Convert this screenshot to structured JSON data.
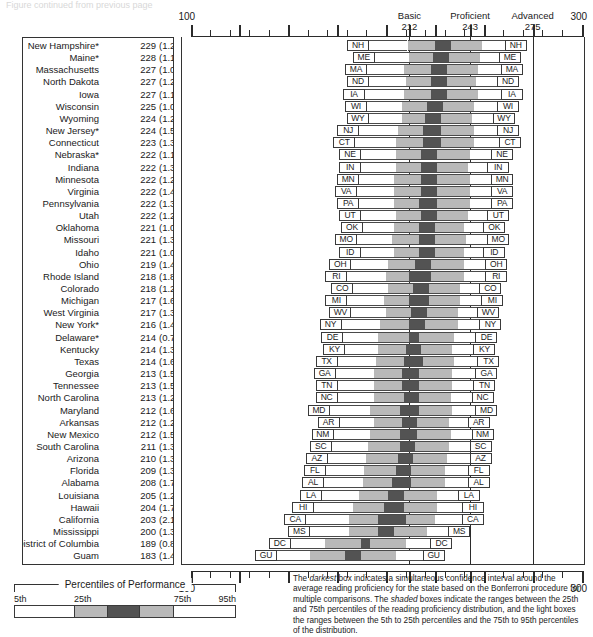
{
  "top_strip_text": "Figure continued from previous page",
  "axis": {
    "min": 100,
    "max": 300,
    "start_label": "100",
    "end_label": "300",
    "bottom_start_label": "100",
    "bottom_end_label": "300",
    "tick_step": 10,
    "major_ticks": [
      125,
      150,
      175,
      200,
      212,
      225,
      243,
      250,
      275,
      300
    ]
  },
  "benchmarks": [
    {
      "name": "Basic",
      "value": "212"
    },
    {
      "name": "Proficient",
      "value": "243"
    },
    {
      "name": "Advanced",
      "value": "275"
    }
  ],
  "legend": {
    "title": "Percentiles of Performance",
    "ticks": [
      "5th",
      "25th",
      "75th",
      "95th"
    ],
    "segments": [
      "light",
      "mid",
      "dark",
      "mid",
      "light"
    ]
  },
  "footnote": "The darkest box indicates a simultaneous confidence interval around the average reading proficiency for the state based on the Bonferroni procedure for multiple comparisons. The shaded boxes indicate the ranges between the 25th and 75th percentiles of the reading proficiency distribution, and the light boxes the ranges between the 5th to 25th percentiles and the 75th to 95th percentiles of the distribution.",
  "footnote_italics": [
    "darkest",
    "shaded"
  ],
  "colors": {
    "light_box": "#ffffff",
    "shaded_box": "#b9b9b9",
    "darkest_box": "#535353",
    "outline": "#4a4a4a",
    "axis": "#2b2b2b"
  },
  "chart_data": {
    "type": "bar",
    "xlabel": "Reading proficiency scale score",
    "ylabel": "State",
    "xlim": [
      100,
      300
    ],
    "grid": false,
    "legend_position": "bottom-left",
    "reference_lines": [
      {
        "label": "Basic",
        "value": 212
      },
      {
        "label": "Proficient",
        "value": 243
      },
      {
        "label": "Advanced",
        "value": 275
      }
    ],
    "columns": [
      "state",
      "mean",
      "se",
      "p5",
      "p25",
      "ci_low",
      "ci_high",
      "p75",
      "p95"
    ],
    "rows": [
      {
        "state": "New Hampshire*",
        "abbr": "NH",
        "mean": 229,
        "se": "1.2",
        "p5": 180,
        "p25": 211,
        "ci_low": 225,
        "ci_high": 233,
        "p75": 249,
        "p95": 272
      },
      {
        "state": "Maine*",
        "abbr": "ME",
        "mean": 228,
        "se": "1.1",
        "p5": 183,
        "p25": 212,
        "ci_low": 224,
        "ci_high": 232,
        "p75": 248,
        "p95": 269
      },
      {
        "state": "Massachusetts",
        "abbr": "MA",
        "mean": 227,
        "se": "1.0",
        "p5": 179,
        "p25": 209,
        "ci_low": 223,
        "ci_high": 231,
        "p75": 247,
        "p95": 270
      },
      {
        "state": "North Dakota",
        "abbr": "ND",
        "mean": 227,
        "se": "1.2",
        "p5": 180,
        "p25": 210,
        "ci_low": 223,
        "ci_high": 231,
        "p75": 246,
        "p95": 268
      },
      {
        "state": "Iowa",
        "abbr": "IA",
        "mean": 227,
        "se": "1.1",
        "p5": 178,
        "p25": 209,
        "ci_low": 223,
        "ci_high": 231,
        "p75": 247,
        "p95": 270
      },
      {
        "state": "Wisconsin",
        "abbr": "WI",
        "mean": 225,
        "se": "1.0",
        "p5": 179,
        "p25": 208,
        "ci_low": 221,
        "ci_high": 229,
        "p75": 245,
        "p95": 268
      },
      {
        "state": "Wyoming",
        "abbr": "WY",
        "mean": 224,
        "se": "1.2",
        "p5": 180,
        "p25": 208,
        "ci_low": 220,
        "ci_high": 228,
        "p75": 244,
        "p95": 266
      },
      {
        "state": "New Jersey*",
        "abbr": "NJ",
        "mean": 224,
        "se": "1.5",
        "p5": 175,
        "p25": 206,
        "ci_low": 219,
        "ci_high": 228,
        "p75": 245,
        "p95": 268
      },
      {
        "state": "Connecticut",
        "abbr": "CT",
        "mean": 223,
        "se": "1.3",
        "p5": 173,
        "p25": 205,
        "ci_low": 219,
        "ci_high": 228,
        "p75": 245,
        "p95": 269
      },
      {
        "state": "Nebraska*",
        "abbr": "NE",
        "mean": 222,
        "se": "1.1",
        "p5": 176,
        "p25": 205,
        "ci_low": 218,
        "ci_high": 226,
        "p75": 243,
        "p95": 265
      },
      {
        "state": "Indiana",
        "abbr": "IN",
        "mean": 222,
        "se": "1.3",
        "p5": 176,
        "p25": 205,
        "ci_low": 218,
        "ci_high": 226,
        "p75": 242,
        "p95": 263
      },
      {
        "state": "Minnesota",
        "abbr": "MN",
        "mean": 222,
        "se": "1.2",
        "p5": 175,
        "p25": 204,
        "ci_low": 218,
        "ci_high": 226,
        "p75": 243,
        "p95": 265
      },
      {
        "state": "Virginia",
        "abbr": "VA",
        "mean": 222,
        "se": "1.4",
        "p5": 174,
        "p25": 204,
        "ci_low": 218,
        "ci_high": 226,
        "p75": 243,
        "p95": 265
      },
      {
        "state": "Pennsylvania",
        "abbr": "PA",
        "mean": 222,
        "se": "1.3",
        "p5": 175,
        "p25": 204,
        "ci_low": 217,
        "ci_high": 226,
        "p75": 243,
        "p95": 265
      },
      {
        "state": "Utah",
        "abbr": "UT",
        "mean": 222,
        "se": "1.2",
        "p5": 176,
        "p25": 205,
        "ci_low": 218,
        "ci_high": 226,
        "p75": 242,
        "p95": 263
      },
      {
        "state": "Oklahoma",
        "abbr": "OK",
        "mean": 221,
        "se": "1.0",
        "p5": 177,
        "p25": 204,
        "ci_low": 217,
        "ci_high": 225,
        "p75": 240,
        "p95": 261
      },
      {
        "state": "Missouri",
        "abbr": "MO",
        "mean": 221,
        "se": "1.3",
        "p5": 174,
        "p25": 203,
        "ci_low": 217,
        "ci_high": 225,
        "p75": 241,
        "p95": 263
      },
      {
        "state": "Idaho",
        "abbr": "ID",
        "mean": 221,
        "se": "1.0",
        "p5": 176,
        "p25": 204,
        "ci_low": 217,
        "ci_high": 225,
        "p75": 240,
        "p95": 261
      },
      {
        "state": "Ohio",
        "abbr": "OH",
        "mean": 219,
        "se": "1.4",
        "p5": 171,
        "p25": 201,
        "ci_low": 215,
        "ci_high": 223,
        "p75": 240,
        "p95": 262
      },
      {
        "state": "Rhode Island",
        "abbr": "RI",
        "mean": 218,
        "se": "1.8",
        "p5": 169,
        "p25": 200,
        "ci_low": 212,
        "ci_high": 223,
        "p75": 240,
        "p95": 262
      },
      {
        "state": "Colorado",
        "abbr": "CO",
        "mean": 218,
        "se": "1.2",
        "p5": 172,
        "p25": 201,
        "ci_low": 214,
        "ci_high": 222,
        "p75": 238,
        "p95": 259
      },
      {
        "state": "Michigan",
        "abbr": "MI",
        "mean": 217,
        "se": "1.6",
        "p5": 169,
        "p25": 199,
        "ci_low": 212,
        "ci_high": 222,
        "p75": 238,
        "p95": 260
      },
      {
        "state": "West Virginia",
        "abbr": "WV",
        "mean": 217,
        "se": "1.3",
        "p5": 171,
        "p25": 200,
        "ci_low": 213,
        "ci_high": 221,
        "p75": 237,
        "p95": 258
      },
      {
        "state": "New York*",
        "abbr": "NY",
        "mean": 216,
        "se": "1.4",
        "p5": 166,
        "p25": 197,
        "ci_low": 212,
        "ci_high": 220,
        "p75": 237,
        "p95": 259
      },
      {
        "state": "Delaware*",
        "abbr": "DE",
        "mean": 214,
        "se": "0.7",
        "p5": 167,
        "p25": 196,
        "ci_low": 212,
        "ci_high": 217,
        "p75": 235,
        "p95": 257
      },
      {
        "state": "Kentucky",
        "abbr": "KY",
        "mean": 214,
        "se": "1.3",
        "p5": 168,
        "p25": 196,
        "ci_low": 210,
        "ci_high": 218,
        "p75": 234,
        "p95": 256
      },
      {
        "state": "Texas",
        "abbr": "TX",
        "mean": 214,
        "se": "1.6",
        "p5": 164,
        "p25": 195,
        "ci_low": 209,
        "ci_high": 219,
        "p75": 235,
        "p95": 258
      },
      {
        "state": "Georgia",
        "abbr": "GA",
        "mean": 213,
        "se": "1.5",
        "p5": 163,
        "p25": 194,
        "ci_low": 208,
        "ci_high": 217,
        "p75": 234,
        "p95": 257
      },
      {
        "state": "Tennessee",
        "abbr": "TN",
        "mean": 213,
        "se": "1.5",
        "p5": 164,
        "p25": 194,
        "ci_low": 208,
        "ci_high": 217,
        "p75": 234,
        "p95": 256
      },
      {
        "state": "North Carolina",
        "abbr": "NC",
        "mean": 213,
        "se": "1.2",
        "p5": 164,
        "p25": 194,
        "ci_low": 209,
        "ci_high": 217,
        "p75": 233,
        "p95": 255
      },
      {
        "state": "Maryland",
        "abbr": "MD",
        "mean": 212,
        "se": "1.6",
        "p5": 160,
        "p25": 192,
        "ci_low": 207,
        "ci_high": 217,
        "p75": 234,
        "p95": 257
      },
      {
        "state": "Arkansas",
        "abbr": "AR",
        "mean": 212,
        "se": "1.2",
        "p5": 165,
        "p25": 194,
        "ci_low": 208,
        "ci_high": 216,
        "p75": 232,
        "p95": 253
      },
      {
        "state": "New Mexico",
        "abbr": "NM",
        "mean": 212,
        "se": "1.5",
        "p5": 162,
        "p25": 192,
        "ci_low": 207,
        "ci_high": 216,
        "p75": 233,
        "p95": 255
      },
      {
        "state": "South Carolina",
        "abbr": "SC",
        "mean": 211,
        "se": "1.3",
        "p5": 161,
        "p25": 191,
        "ci_low": 207,
        "ci_high": 215,
        "p75": 232,
        "p95": 254
      },
      {
        "state": "Arizona",
        "abbr": "AZ",
        "mean": 210,
        "se": "1.3",
        "p5": 159,
        "p25": 190,
        "ci_low": 206,
        "ci_high": 214,
        "p75": 231,
        "p95": 254
      },
      {
        "state": "Florida",
        "abbr": "FL",
        "mean": 209,
        "se": "1.3",
        "p5": 158,
        "p25": 189,
        "ci_low": 205,
        "ci_high": 213,
        "p75": 230,
        "p95": 253
      },
      {
        "state": "Alabama",
        "abbr": "AL",
        "mean": 208,
        "se": "1.7",
        "p5": 157,
        "p25": 188,
        "ci_low": 203,
        "ci_high": 213,
        "p75": 230,
        "p95": 253
      },
      {
        "state": "Louisiana",
        "abbr": "LA",
        "mean": 205,
        "se": "1.2",
        "p5": 156,
        "p25": 186,
        "ci_low": 201,
        "ci_high": 209,
        "p75": 226,
        "p95": 248
      },
      {
        "state": "Hawaii",
        "abbr": "HI",
        "mean": 204,
        "se": "1.7",
        "p5": 152,
        "p25": 183,
        "ci_low": 199,
        "ci_high": 209,
        "p75": 226,
        "p95": 250
      },
      {
        "state": "California",
        "abbr": "CA",
        "mean": 203,
        "se": "2.1",
        "p5": 148,
        "p25": 181,
        "ci_low": 196,
        "ci_high": 210,
        "p75": 225,
        "p95": 250
      },
      {
        "state": "Mississippi",
        "abbr": "MS",
        "mean": 200,
        "se": "1.3",
        "p5": 150,
        "p25": 181,
        "ci_low": 196,
        "ci_high": 204,
        "p75": 221,
        "p95": 243
      },
      {
        "state": "District of Columbia",
        "abbr": "DC",
        "mean": 189,
        "se": "0.8",
        "p5": 140,
        "p25": 169,
        "ci_low": 187,
        "ci_high": 192,
        "p75": 210,
        "p95": 234
      },
      {
        "state": "Guam",
        "abbr": "GU",
        "mean": 183,
        "se": "1.4",
        "p5": 133,
        "p25": 161,
        "ci_low": 179,
        "ci_high": 187,
        "p75": 205,
        "p95": 230
      }
    ]
  }
}
